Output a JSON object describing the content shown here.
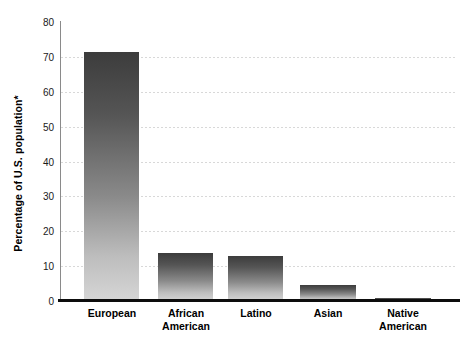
{
  "chart_data": {
    "type": "bar",
    "title": "",
    "xlabel": "",
    "ylabel": "Percentage of U.S. population*",
    "categories": [
      "European",
      "African American",
      "Latino",
      "Asian",
      "Native American"
    ],
    "values": [
      71.5,
      13.7,
      12.8,
      4.6,
      1.0
    ],
    "ylim": [
      0,
      80
    ],
    "yticks": [
      0,
      10,
      20,
      30,
      40,
      50,
      60,
      70,
      80
    ],
    "ytick_labels": [
      "0",
      "10",
      "20",
      "30",
      "40",
      "50",
      "60",
      "70",
      "80"
    ],
    "grid": true,
    "legend": "none",
    "series": [
      {
        "name": "Percentage of U.S. population*",
        "values": [
          71.5,
          13.7,
          12.8,
          4.6,
          1.0
        ]
      }
    ],
    "bar_gradient_top_color": "#3c3c3c",
    "bar_gradient_bottom_color": "#d6d6d6",
    "axis_color": "#0d0d0d",
    "gridline_color": "#d8d8d8",
    "background_color": "#ffffff"
  },
  "axis": {
    "y_title": "Percentage of U.S. population*"
  },
  "categories_display": [
    "European",
    "African\nAmerican",
    "Latino",
    "Asian",
    "Native\nAmerican"
  ]
}
